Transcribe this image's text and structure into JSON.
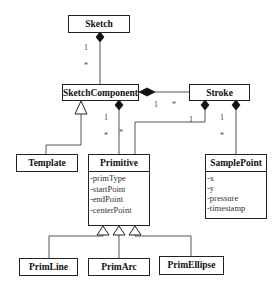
{
  "diagram": {
    "type": "UML class diagram",
    "classes": {
      "sketch": {
        "name": "Sketch"
      },
      "sketch_component": {
        "name": "SketchComponent"
      },
      "stroke": {
        "name": "Stroke"
      },
      "template": {
        "name": "Template"
      },
      "primitive": {
        "name": "Primitive",
        "attributes": [
          "-primType",
          "-startPoint",
          "-endPoint",
          "-centerPoint"
        ]
      },
      "sample_point": {
        "name": "SamplePoint",
        "attributes": [
          "-x",
          "-y",
          "-pressure",
          "-timestamp"
        ]
      },
      "prim_line": {
        "name": "PrimLine"
      },
      "prim_arc": {
        "name": "PrimArc"
      },
      "prim_ellipse": {
        "name": "PrimEllipse"
      }
    },
    "relationships": [
      {
        "type": "composition",
        "whole": "Sketch",
        "part": "SketchComponent",
        "mult_whole": "1",
        "mult_part": "*"
      },
      {
        "type": "composition",
        "whole": "SketchComponent",
        "part": "Stroke",
        "mult_whole": "1",
        "mult_part": "*"
      },
      {
        "type": "composition",
        "whole": "SketchComponent",
        "part": "Primitive",
        "mult_whole": "1",
        "mult_part": "*"
      },
      {
        "type": "composition",
        "whole": "Stroke",
        "part": "Primitive",
        "mult_whole": "1"
      },
      {
        "type": "composition",
        "whole": "Stroke",
        "part": "SamplePoint",
        "mult_whole": "1",
        "mult_part": "*"
      },
      {
        "type": "generalization",
        "parent": "SketchComponent",
        "child": "Template"
      },
      {
        "type": "generalization",
        "parent": "Primitive",
        "child": "PrimLine"
      },
      {
        "type": "generalization",
        "parent": "Primitive",
        "child": "PrimArc"
      },
      {
        "type": "generalization",
        "parent": "Primitive",
        "child": "PrimEllipse"
      }
    ],
    "multiplicity_labels": {
      "sketch_sc_one": "1",
      "sketch_sc_many": "*",
      "sc_stroke_one": "1",
      "sc_stroke_many": "*",
      "sc_prim_one": "1",
      "sc_prim_many": "*",
      "stroke_prim_one": "1",
      "stroke_sp_one": "1",
      "stroke_sp_many": "*"
    }
  }
}
